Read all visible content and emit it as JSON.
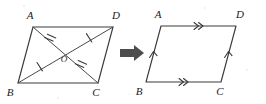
{
  "figure": {
    "background_color": "#ffffff",
    "line_color": "#3a3a3a",
    "arrow_color": "#4d4d4d",
    "transform_arrow": {
      "icon": "right-arrow-icon",
      "direction": "right"
    }
  },
  "left_figure": {
    "name": "parallelogram-with-diagonals",
    "vertices": [
      {
        "id": "A",
        "label": "A",
        "position": "top-left"
      },
      {
        "id": "D",
        "label": "D",
        "position": "top-right"
      },
      {
        "id": "B",
        "label": "B",
        "position": "bottom-left"
      },
      {
        "id": "C",
        "label": "C",
        "position": "bottom-right"
      }
    ],
    "center": {
      "id": "O",
      "label": "O"
    },
    "diagonals": [
      {
        "id": "AC",
        "from": "A",
        "to": "C",
        "tick_count": 2
      },
      {
        "id": "BD",
        "from": "B",
        "to": "D",
        "tick_count": 1
      }
    ],
    "segments": [
      {
        "id": "AO",
        "tick_count": 2
      },
      {
        "id": "OC",
        "tick_count": 2
      },
      {
        "id": "BO",
        "tick_count": 1
      },
      {
        "id": "OD",
        "tick_count": 1
      }
    ]
  },
  "right_figure": {
    "name": "parallelogram-with-parallel-marks",
    "vertices": [
      {
        "id": "A",
        "label": "A",
        "position": "top-left"
      },
      {
        "id": "D",
        "label": "D",
        "position": "top-right"
      },
      {
        "id": "B",
        "label": "B",
        "position": "bottom-left"
      },
      {
        "id": "C",
        "label": "C",
        "position": "bottom-right"
      }
    ],
    "sides": [
      {
        "id": "AD",
        "from": "A",
        "to": "D",
        "chevron_count": 2
      },
      {
        "id": "BC",
        "from": "B",
        "to": "C",
        "chevron_count": 2
      },
      {
        "id": "AB",
        "from": "A",
        "to": "B",
        "chevron_count": 1
      },
      {
        "id": "DC",
        "from": "D",
        "to": "C",
        "chevron_count": 1
      }
    ]
  }
}
